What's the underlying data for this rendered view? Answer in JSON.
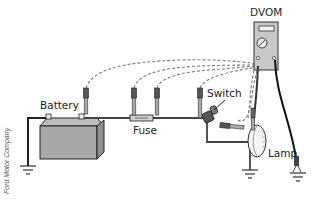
{
  "diagram": {
    "labels": {
      "meter": "DVOM",
      "battery": "Battery",
      "fuse": "Fuse",
      "switch": "Switch",
      "lamp": "Lamp"
    },
    "credit": "Ford Motor Company",
    "components": [
      {
        "id": "battery",
        "label": "Battery"
      },
      {
        "id": "fuse",
        "label": "Fuse"
      },
      {
        "id": "switch",
        "label": "Switch"
      },
      {
        "id": "lamp",
        "label": "Lamp"
      },
      {
        "id": "dvom",
        "label": "DVOM"
      }
    ],
    "probe_points": [
      {
        "id": "p1",
        "location": "battery-positive-terminal"
      },
      {
        "id": "p2",
        "location": "fuse-input"
      },
      {
        "id": "p3",
        "location": "fuse-output"
      },
      {
        "id": "p4",
        "location": "switch-input"
      },
      {
        "id": "p5",
        "location": "switch-output"
      },
      {
        "id": "p6",
        "location": "lamp-input"
      }
    ],
    "grounds": [
      "battery-ground",
      "lamp-ground",
      "dvom-ground"
    ],
    "colors": {
      "wire": "#3a3a3a",
      "lead": "#111111",
      "dashed": "#777777",
      "battery_fill": "#a8a8a8",
      "meter_fill": "#c8c8c8"
    }
  }
}
